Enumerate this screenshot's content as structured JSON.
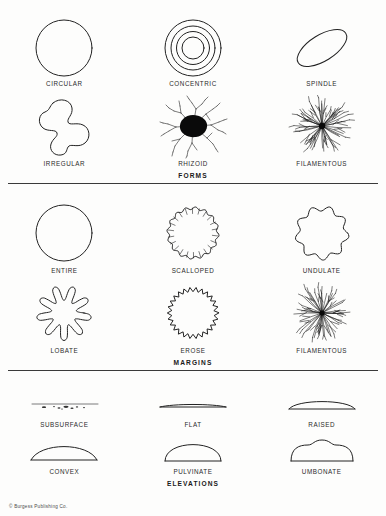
{
  "document": {
    "title": "Bacterial Colony Morphology Chart",
    "copyright": "© Burgess Publishing Co."
  },
  "sections": [
    {
      "id": "forms",
      "heading": "FORMS",
      "items": [
        {
          "label": "CIRCULAR",
          "icon": "circular-colony-icon"
        },
        {
          "label": "CONCENTRIC",
          "icon": "concentric-colony-icon"
        },
        {
          "label": "SPINDLE",
          "icon": "spindle-colony-icon"
        },
        {
          "label": "IRREGULAR",
          "icon": "irregular-colony-icon"
        },
        {
          "label": "RHIZOID",
          "icon": "rhizoid-colony-icon"
        },
        {
          "label": "FILAMENTOUS",
          "icon": "filamentous-colony-icon"
        }
      ]
    },
    {
      "id": "margins",
      "heading": "MARGINS",
      "items": [
        {
          "label": "ENTIRE",
          "icon": "entire-margin-icon"
        },
        {
          "label": "SCALLOPED",
          "icon": "scalloped-margin-icon"
        },
        {
          "label": "UNDULATE",
          "icon": "undulate-margin-icon"
        },
        {
          "label": "LOBATE",
          "icon": "lobate-margin-icon"
        },
        {
          "label": "EROSE",
          "icon": "erose-margin-icon"
        },
        {
          "label": "FILAMENTOUS",
          "icon": "filamentous-margin-icon"
        }
      ]
    },
    {
      "id": "elevations",
      "heading": "ELEVATIONS",
      "items": [
        {
          "label": "SUBSURFACE",
          "icon": "subsurface-elevation-icon"
        },
        {
          "label": "FLAT",
          "icon": "flat-elevation-icon"
        },
        {
          "label": "RAISED",
          "icon": "raised-elevation-icon"
        },
        {
          "label": "CONVEX",
          "icon": "convex-elevation-icon"
        },
        {
          "label": "PULVINATE",
          "icon": "pulvinate-elevation-icon"
        },
        {
          "label": "UMBONATE",
          "icon": "umbonate-elevation-icon"
        }
      ]
    }
  ],
  "colors": {
    "ink": "#222222",
    "paper": "#fdfdfc",
    "rule": "#3a3a3a"
  }
}
